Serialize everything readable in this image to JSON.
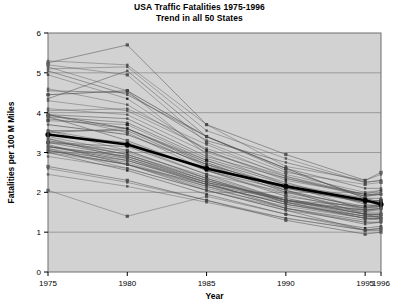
{
  "chart_data": {
    "type": "line",
    "title": "USA Traffic Fatalities 1975-1996",
    "subtitle": "Trend in all 50 States",
    "xlabel": "Year",
    "ylabel": "Fatalities per 100 M Miles",
    "categories": [
      "1975",
      "1980",
      "1985",
      "1990",
      "1995",
      "1996"
    ],
    "xtick_labels": [
      "1975",
      "1980",
      "1985",
      "1990",
      "1995",
      "1996"
    ],
    "ytick_labels": [
      "0",
      "1",
      "2",
      "3",
      "4",
      "5",
      "6"
    ],
    "ylim": [
      0,
      6
    ],
    "grid": true,
    "legend": "none",
    "plot_background": "#d2d2d2",
    "series_color": "#555555",
    "average_color": "#000000",
    "marker": "square",
    "series": [
      {
        "name": "Alabama",
        "values": [
          4.45,
          4.55,
          3.4,
          2.6,
          1.85,
          1.75
        ]
      },
      {
        "name": "Alaska",
        "values": [
          5.15,
          4.55,
          2.95,
          2.2,
          1.55,
          1.55
        ]
      },
      {
        "name": "Arizona",
        "values": [
          5.3,
          5.2,
          3.7,
          2.65,
          2.3,
          2.45
        ]
      },
      {
        "name": "Arkansas",
        "values": [
          4.35,
          5.05,
          3.4,
          2.55,
          1.9,
          1.95
        ]
      },
      {
        "name": "California",
        "values": [
          3.45,
          3.25,
          2.55,
          2.05,
          1.45,
          1.35
        ]
      },
      {
        "name": "Colorado",
        "values": [
          3.95,
          3.5,
          2.55,
          1.95,
          1.5,
          1.6
        ]
      },
      {
        "name": "Connecticut",
        "values": [
          3.05,
          2.7,
          2.05,
          1.55,
          1.05,
          1.1
        ]
      },
      {
        "name": "Delaware",
        "values": [
          3.55,
          3.2,
          2.45,
          2.0,
          1.55,
          1.65
        ]
      },
      {
        "name": "Florida",
        "values": [
          3.95,
          3.85,
          2.9,
          2.35,
          1.95,
          1.95
        ]
      },
      {
        "name": "Georgia",
        "values": [
          3.9,
          3.75,
          2.85,
          2.25,
          1.7,
          1.65
        ]
      },
      {
        "name": "Hawaii",
        "values": [
          3.25,
          3.05,
          2.35,
          1.75,
          1.35,
          1.3
        ]
      },
      {
        "name": "Idaho",
        "values": [
          4.6,
          4.2,
          3.05,
          2.35,
          1.9,
          2.0
        ]
      },
      {
        "name": "Illinois",
        "values": [
          3.15,
          2.9,
          2.25,
          1.85,
          1.45,
          1.45
        ]
      },
      {
        "name": "Indiana",
        "values": [
          3.3,
          2.95,
          2.35,
          1.75,
          1.35,
          1.35
        ]
      },
      {
        "name": "Iowa",
        "values": [
          3.4,
          3.0,
          2.4,
          1.8,
          1.55,
          1.6
        ]
      },
      {
        "name": "Kansas",
        "values": [
          3.25,
          3.15,
          2.45,
          1.8,
          1.65,
          1.7
        ]
      },
      {
        "name": "Kentucky",
        "values": [
          3.55,
          3.55,
          2.65,
          2.1,
          1.75,
          1.8
        ]
      },
      {
        "name": "Louisiana",
        "values": [
          4.05,
          4.1,
          3.2,
          2.4,
          1.9,
          1.95
        ]
      },
      {
        "name": "Maine",
        "values": [
          3.15,
          2.85,
          2.2,
          1.7,
          1.35,
          1.35
        ]
      },
      {
        "name": "Maryland",
        "values": [
          3.1,
          2.75,
          2.15,
          1.75,
          1.4,
          1.4
        ]
      },
      {
        "name": "Massachusetts",
        "values": [
          2.65,
          2.3,
          1.8,
          1.3,
          0.95,
          1.0
        ]
      },
      {
        "name": "Michigan",
        "values": [
          3.05,
          2.7,
          2.2,
          1.8,
          1.45,
          1.45
        ]
      },
      {
        "name": "Minnesota",
        "values": [
          3.1,
          2.6,
          2.05,
          1.55,
          1.25,
          1.25
        ]
      },
      {
        "name": "Mississippi",
        "values": [
          5.1,
          5.15,
          3.55,
          2.85,
          2.25,
          2.3
        ]
      },
      {
        "name": "Missouri",
        "values": [
          3.7,
          3.45,
          2.7,
          2.15,
          1.75,
          1.8
        ]
      },
      {
        "name": "Montana",
        "values": [
          5.2,
          4.95,
          3.25,
          2.5,
          2.2,
          2.25
        ]
      },
      {
        "name": "Nebraska",
        "values": [
          3.35,
          2.95,
          2.3,
          1.75,
          1.55,
          1.6
        ]
      },
      {
        "name": "Nevada",
        "values": [
          5.05,
          4.45,
          3.4,
          2.6,
          2.1,
          2.1
        ]
      },
      {
        "name": "New Hampshire",
        "values": [
          3.0,
          2.55,
          1.95,
          1.45,
          1.1,
          1.15
        ]
      },
      {
        "name": "New Jersey",
        "values": [
          2.45,
          2.15,
          1.75,
          1.35,
          1.05,
          1.05
        ]
      },
      {
        "name": "New Mexico",
        "values": [
          5.25,
          5.7,
          3.7,
          2.95,
          2.3,
          2.5
        ]
      },
      {
        "name": "New York",
        "values": [
          2.9,
          2.6,
          2.05,
          1.6,
          1.25,
          1.25
        ]
      },
      {
        "name": "North Carolina",
        "values": [
          3.85,
          3.6,
          2.8,
          2.2,
          1.85,
          1.85
        ]
      },
      {
        "name": "North Dakota",
        "values": [
          3.35,
          2.85,
          2.25,
          1.6,
          1.3,
          1.35
        ]
      },
      {
        "name": "Ohio",
        "values": [
          3.0,
          2.7,
          2.1,
          1.65,
          1.35,
          1.35
        ]
      },
      {
        "name": "Oklahoma",
        "values": [
          3.8,
          3.7,
          2.8,
          2.1,
          1.75,
          1.8
        ]
      },
      {
        "name": "Oregon",
        "values": [
          3.95,
          3.6,
          2.75,
          2.05,
          1.6,
          1.65
        ]
      },
      {
        "name": "Pennsylvania",
        "values": [
          3.05,
          2.8,
          2.25,
          1.8,
          1.5,
          1.5
        ]
      },
      {
        "name": "Rhode Island",
        "values": [
          2.6,
          2.25,
          1.8,
          1.35,
          1.05,
          1.05
        ]
      },
      {
        "name": "South Carolina",
        "values": [
          4.55,
          4.5,
          3.3,
          2.75,
          2.25,
          2.3
        ]
      },
      {
        "name": "South Dakota",
        "values": [
          3.9,
          3.3,
          2.55,
          1.9,
          1.6,
          1.7
        ]
      },
      {
        "name": "Tennessee",
        "values": [
          4.1,
          3.95,
          3.0,
          2.4,
          1.95,
          1.95
        ]
      },
      {
        "name": "Texas",
        "values": [
          3.5,
          3.6,
          2.7,
          2.0,
          1.65,
          1.65
        ]
      },
      {
        "name": "Utah",
        "values": [
          3.55,
          3.05,
          2.35,
          1.8,
          1.55,
          1.6
        ]
      },
      {
        "name": "Vermont",
        "values": [
          3.2,
          2.7,
          2.15,
          1.6,
          1.2,
          1.25
        ]
      },
      {
        "name": "Virginia",
        "values": [
          3.25,
          2.9,
          2.3,
          1.8,
          1.45,
          1.45
        ]
      },
      {
        "name": "Washington",
        "values": [
          3.3,
          2.95,
          2.3,
          1.8,
          1.4,
          1.4
        ]
      },
      {
        "name": "West Virginia",
        "values": [
          4.3,
          4.05,
          3.1,
          2.45,
          2.0,
          2.05
        ]
      },
      {
        "name": "Wisconsin",
        "values": [
          3.15,
          2.8,
          2.2,
          1.7,
          1.4,
          1.4
        ]
      },
      {
        "name": "Wyoming",
        "values": [
          4.95,
          4.35,
          3.05,
          2.3,
          1.95,
          2.05
        ]
      },
      {
        "name": "Low Outlier",
        "values": [
          2.05,
          1.4,
          1.9,
          1.45,
          1.05,
          1.1
        ]
      }
    ],
    "average": {
      "name": "USA Average",
      "values": [
        3.45,
        3.2,
        2.6,
        2.15,
        1.8,
        1.7
      ]
    }
  }
}
